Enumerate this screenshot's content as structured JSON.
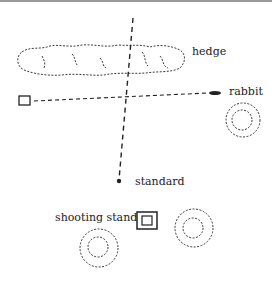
{
  "labels": {
    "hedge": "hedge",
    "rabbit": "rabbit",
    "standard": "standard",
    "shooting_stand": "shooting stand"
  },
  "colors": {
    "ink": "#222222",
    "border": "#9a9a9a"
  }
}
